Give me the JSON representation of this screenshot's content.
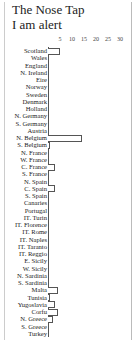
{
  "chart_data": {
    "type": "bar",
    "orientation": "horizontal",
    "title": "The Nose Tap",
    "subtitle": "I am alert",
    "xlabel": "",
    "ylabel": "",
    "xticks": [
      5,
      10,
      15,
      20,
      25,
      30
    ],
    "xlim": [
      0,
      30
    ],
    "grid": false,
    "categories": [
      "Scotland",
      "Wales",
      "England",
      "N. Ireland",
      "Eire",
      "Norway",
      "Sweden",
      "Denmark",
      "Holland",
      "N. Germany",
      "S. Germany",
      "Austria",
      "N. Belgium",
      "S. Belgium",
      "N. France",
      "W. France",
      "C. France",
      "S. France",
      "N. Spain",
      "C. Spain",
      "S. Spain",
      "Canaries",
      "Portugal",
      "IT. Turin",
      "IT. Florence",
      "IT. Rome",
      "IT. Naples",
      "IT. Taranto",
      "IT. Reggio",
      "E. Sicily",
      "W. Sicily",
      "N. Sardinia",
      "S. Sardinia",
      "Malta",
      "Tunisia",
      "Yugoslavia",
      "Corfu",
      "N. Greece",
      "S. Greece",
      "Turkey"
    ],
    "values": [
      5,
      0,
      0,
      0,
      0,
      0,
      0,
      0,
      0,
      0,
      0,
      0,
      14,
      1,
      0,
      0,
      3,
      0,
      0,
      3,
      0,
      0,
      0,
      0,
      0,
      0,
      0,
      0,
      0,
      0,
      0,
      0,
      0,
      4,
      1,
      3,
      4,
      2,
      0,
      0
    ]
  }
}
